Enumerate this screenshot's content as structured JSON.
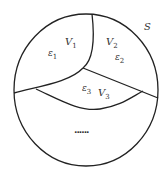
{
  "diagram": {
    "set_label": "S",
    "regions": [
      {
        "name": "V",
        "sub": "1",
        "eps": "ε",
        "eps_sub": "1"
      },
      {
        "name": "V",
        "sub": "2",
        "eps": "ε",
        "eps_sub": "2"
      },
      {
        "name": "V",
        "sub": "3",
        "eps": "ε",
        "eps_sub": "3"
      }
    ],
    "ellipsis": "......"
  }
}
